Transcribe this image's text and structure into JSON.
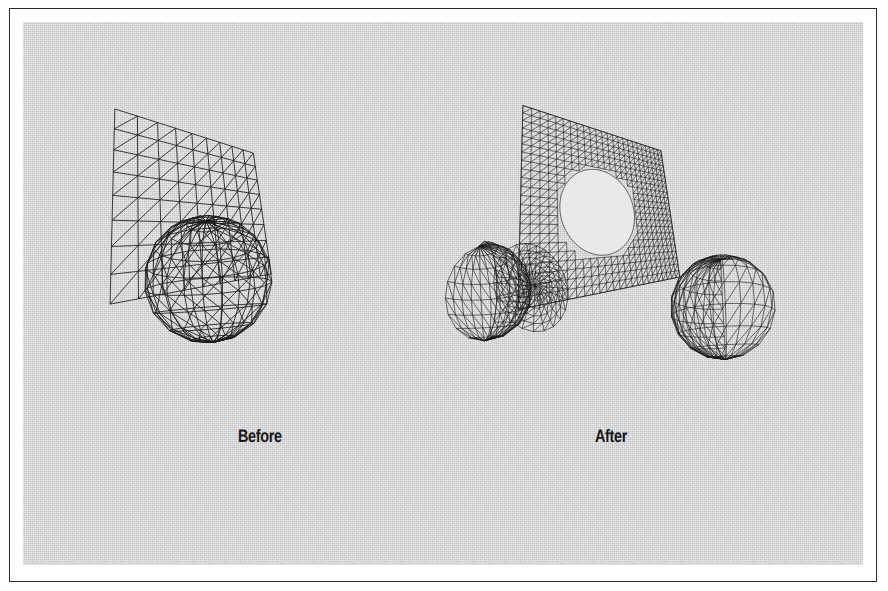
{
  "figure": {
    "kind": "line-illustration",
    "background_color": "#c9c9c9",
    "ink_color": "#1a1a1a",
    "frame_color": "#2b2b2b",
    "page_color": "#ffffff",
    "captions": [
      {
        "id": "before",
        "label": "Before"
      },
      {
        "id": "after",
        "label": "After"
      }
    ],
    "panels": [
      {
        "id": "before",
        "caption": "Before",
        "description": "A triangulated quadrilateral mesh plane interpenetrating a wireframe sphere; the two surfaces intersect but share no common edges.",
        "objects": [
          {
            "name": "mesh-plane",
            "type": "triangulated-quad-plane",
            "rows": 8,
            "cols": 9
          },
          {
            "name": "wireframe-sphere",
            "type": "triangulated-sphere",
            "stacks": 9,
            "slices": 16
          }
        ]
      },
      {
        "id": "after",
        "caption": "After",
        "description": "Exploded view of the boolean/remesh result: the sphere is split into a cap and a body, a circular disc patch is extracted, and the plane now carries a conforming circular hole.",
        "objects": [
          {
            "name": "sphere-cap-piece",
            "type": "triangulated-spherical-cap"
          },
          {
            "name": "circular-disc-patch",
            "type": "triangulated-disc"
          },
          {
            "name": "plane-with-hole",
            "type": "triangulated-plane-with-circular-hole"
          },
          {
            "name": "sphere-body-piece",
            "type": "triangulated-sphere-remainder"
          }
        ]
      }
    ]
  }
}
